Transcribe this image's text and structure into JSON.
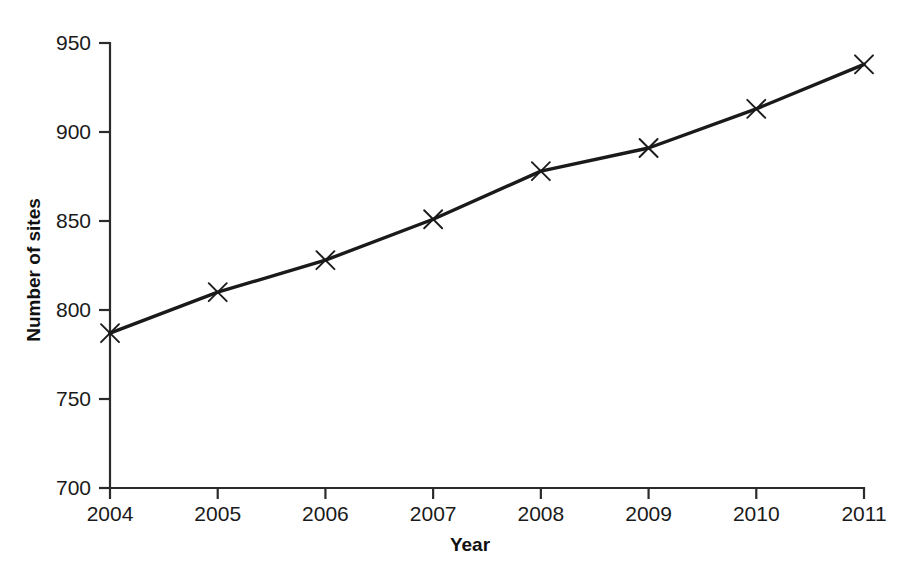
{
  "chart_data": {
    "type": "line",
    "title": "",
    "subtitle": "",
    "xlabel": "Year",
    "ylabel": "Number of sites",
    "x": [
      2004,
      2005,
      2006,
      2007,
      2008,
      2009,
      2010,
      2011
    ],
    "categories": [
      "2004",
      "2005",
      "2006",
      "2007",
      "2008",
      "2009",
      "2010",
      "2011"
    ],
    "values": [
      787,
      810,
      828,
      851,
      878,
      891,
      913,
      938
    ],
    "series": [
      {
        "name": "Number of sites",
        "values": [
          787,
          810,
          828,
          851,
          878,
          891,
          913,
          938
        ]
      }
    ],
    "xlim": [
      2004,
      2011
    ],
    "ylim": [
      700,
      950
    ],
    "y_ticks": [
      700,
      750,
      800,
      850,
      900,
      950
    ],
    "y_tick_labels": [
      "700",
      "750",
      "800",
      "850",
      "900",
      "950"
    ],
    "x_ticks": [
      2004,
      2005,
      2006,
      2007,
      2008,
      2009,
      2010,
      2011
    ],
    "x_tick_labels": [
      "2004",
      "2005",
      "2006",
      "2007",
      "2008",
      "2009",
      "2010",
      "2011"
    ],
    "grid": false,
    "legend": false,
    "legend_position": "none",
    "marker": "x",
    "line_color": "#1a1a1a",
    "axis_color": "#2b2b2b",
    "background_color": "#ffffff"
  }
}
